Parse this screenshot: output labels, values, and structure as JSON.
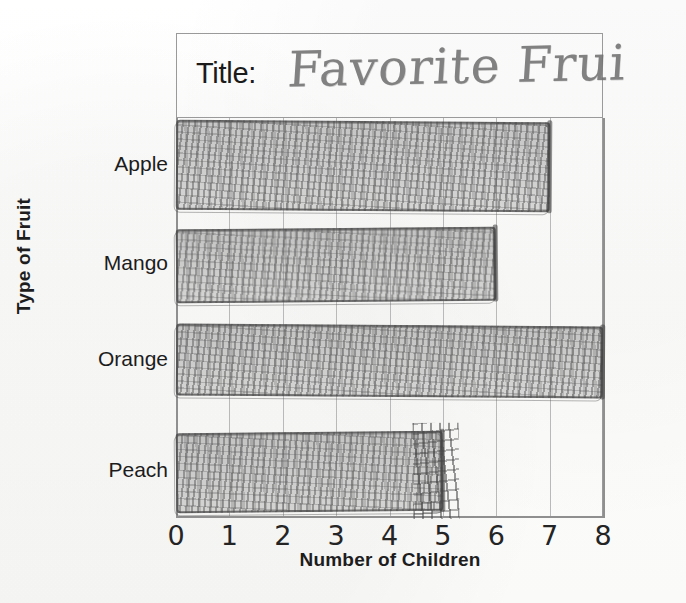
{
  "page": {
    "background_color": "#fdfdfd",
    "ink_color": "#6e6e6e",
    "axis_color": "#8f8f8f",
    "grid_color": "#b9b9b9"
  },
  "title_box": {
    "prefix_label": "Title:",
    "handwritten_title": "Favorite Frui"
  },
  "axes": {
    "y_axis_title": "Type of Fruit",
    "x_axis_title": "Number of Children",
    "x_tick_labels": [
      "0",
      "1",
      "2",
      "3",
      "4",
      "5",
      "6",
      "7",
      "8"
    ],
    "category_labels": [
      "Apple",
      "Mango",
      "Orange",
      "Peach"
    ]
  },
  "chart_data": {
    "type": "bar",
    "orientation": "horizontal",
    "title": "Favorite Frui",
    "xlabel": "Number of Children",
    "ylabel": "Type of Fruit",
    "categories": [
      "Apple",
      "Mango",
      "Orange",
      "Peach"
    ],
    "values": [
      7,
      6,
      8,
      5
    ],
    "xlim": [
      0,
      8
    ],
    "xticks": [
      0,
      1,
      2,
      3,
      4,
      5,
      6,
      7,
      8
    ],
    "grid": true,
    "legend": "none",
    "style": "hand-drawn pencil on grid paper",
    "annotations": [
      "Peach bar has heavy pencil scribble/erasure marks near its end at 5"
    ]
  },
  "bars": [
    {
      "name": "apple",
      "label": "Apple",
      "value": 7,
      "top": 3,
      "height": 90,
      "has_scribble": false
    },
    {
      "name": "mango",
      "label": "Mango",
      "value": 6,
      "top": 110,
      "height": 74,
      "has_scribble": false
    },
    {
      "name": "orange",
      "label": "Orange",
      "value": 8,
      "top": 207,
      "height": 72,
      "has_scribble": false
    },
    {
      "name": "peach",
      "label": "Peach",
      "value": 5,
      "top": 314,
      "height": 80,
      "has_scribble": true
    }
  ]
}
